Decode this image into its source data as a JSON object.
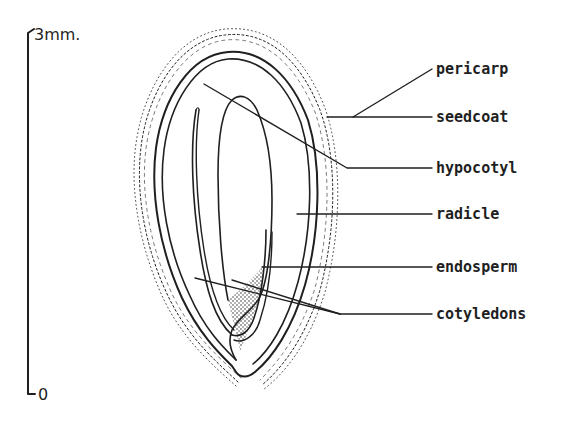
{
  "figure": {
    "type": "botanical longitudinal section of seed",
    "scale_bar": {
      "top_label": "3mm.",
      "bottom_label": "0"
    },
    "labels": [
      {
        "id": "pericarp",
        "text": "pericarp"
      },
      {
        "id": "seedcoat",
        "text": "seedcoat"
      },
      {
        "id": "hypocotyl",
        "text": "hypocotyl"
      },
      {
        "id": "radicle",
        "text": "radicle"
      },
      {
        "id": "endosperm",
        "text": "endosperm"
      },
      {
        "id": "cotyledons",
        "text": "cotyledons"
      }
    ],
    "colors": {
      "ink": "#1f1f1f",
      "background": "#ffffff"
    }
  }
}
